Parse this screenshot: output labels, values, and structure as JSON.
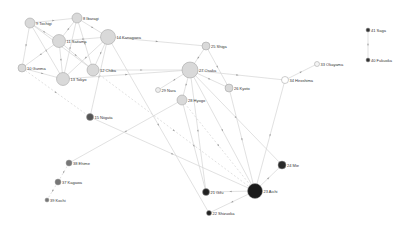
{
  "diagram": {
    "type": "network-graph",
    "nodes": [
      {
        "id": "9",
        "label": "9 Tochigi",
        "x": 30,
        "y": 23,
        "r": 5,
        "color": "#d9d9d9"
      },
      {
        "id": "8",
        "label": "8 Ibaragi",
        "x": 77,
        "y": 18,
        "r": 5,
        "color": "#d9d9d9"
      },
      {
        "id": "11",
        "label": "11 Saitama",
        "x": 59,
        "y": 41,
        "r": 6.5,
        "color": "#d9d9d9"
      },
      {
        "id": "14",
        "label": "14 Kanagawa",
        "x": 108,
        "y": 37,
        "r": 7.5,
        "color": "#d9d9d9"
      },
      {
        "id": "10",
        "label": "10 Gunma",
        "x": 22,
        "y": 68,
        "r": 4,
        "color": "#d9d9d9"
      },
      {
        "id": "13",
        "label": "13 Tokyo",
        "x": 63,
        "y": 79,
        "r": 6.5,
        "color": "#d9d9d9"
      },
      {
        "id": "12",
        "label": "12 Chiba",
        "x": 93,
        "y": 70,
        "r": 6,
        "color": "#d9d9d9"
      },
      {
        "id": "25",
        "label": "25 Shiga",
        "x": 206,
        "y": 46,
        "r": 4,
        "color": "#d9d9d9"
      },
      {
        "id": "27",
        "label": "27 Osaka",
        "x": 190,
        "y": 70,
        "r": 8,
        "color": "#d9d9d9"
      },
      {
        "id": "33",
        "label": "33 Okayama",
        "x": 317,
        "y": 64,
        "r": 2.5,
        "color": "#f4f4f4"
      },
      {
        "id": "34",
        "label": "34 Hiroshima",
        "x": 285,
        "y": 80,
        "r": 3.5,
        "color": "#ffffff"
      },
      {
        "id": "29",
        "label": "29 Nara",
        "x": 158,
        "y": 90,
        "r": 2.5,
        "color": "#eeeeee"
      },
      {
        "id": "26",
        "label": "26 Kyoto",
        "x": 229,
        "y": 88,
        "r": 4,
        "color": "#d9d9d9"
      },
      {
        "id": "28",
        "label": "28 Hyogo",
        "x": 182,
        "y": 100,
        "r": 5,
        "color": "#d9d9d9"
      },
      {
        "id": "15",
        "label": "15 Niigata",
        "x": 90,
        "y": 117,
        "r": 3.5,
        "color": "#555555"
      },
      {
        "id": "41",
        "label": "41 Saga",
        "x": 368,
        "y": 30,
        "r": 2,
        "color": "#333333"
      },
      {
        "id": "40",
        "label": "40 Fukuoka",
        "x": 368,
        "y": 60,
        "r": 2,
        "color": "#333333"
      },
      {
        "id": "38",
        "label": "38 Ehime",
        "x": 69,
        "y": 163,
        "r": 3,
        "color": "#777777"
      },
      {
        "id": "37",
        "label": "37 Kagawa",
        "x": 58,
        "y": 182,
        "r": 3,
        "color": "#777777"
      },
      {
        "id": "39",
        "label": "39 Kochi",
        "x": 47,
        "y": 200,
        "r": 2,
        "color": "#777777"
      },
      {
        "id": "24",
        "label": "24 Mie",
        "x": 282,
        "y": 165,
        "r": 4,
        "color": "#2a2a2a"
      },
      {
        "id": "23",
        "label": "23 Aichi",
        "x": 255,
        "y": 191,
        "r": 7.5,
        "color": "#1a1a1a"
      },
      {
        "id": "21",
        "label": "21 Gifu",
        "x": 206,
        "y": 192,
        "r": 3.5,
        "color": "#222222"
      },
      {
        "id": "22",
        "label": "22 Shizuoka",
        "x": 209,
        "y": 213,
        "r": 2.5,
        "color": "#222222"
      }
    ],
    "edges": [
      {
        "from": "9",
        "to": "8"
      },
      {
        "from": "9",
        "to": "11"
      },
      {
        "from": "9",
        "to": "10"
      },
      {
        "from": "9",
        "to": "13"
      },
      {
        "from": "9",
        "to": "12"
      },
      {
        "from": "8",
        "to": "11"
      },
      {
        "from": "8",
        "to": "14"
      },
      {
        "from": "8",
        "to": "13"
      },
      {
        "from": "8",
        "to": "12"
      },
      {
        "from": "11",
        "to": "14"
      },
      {
        "from": "11",
        "to": "10"
      },
      {
        "from": "11",
        "to": "13"
      },
      {
        "from": "11",
        "to": "12"
      },
      {
        "from": "14",
        "to": "13"
      },
      {
        "from": "14",
        "to": "12"
      },
      {
        "from": "14",
        "to": "25"
      },
      {
        "from": "14",
        "to": "15"
      },
      {
        "from": "14",
        "to": "22"
      },
      {
        "from": "10",
        "to": "13"
      },
      {
        "from": "10",
        "to": "15",
        "dashed": true
      },
      {
        "from": "13",
        "to": "27"
      },
      {
        "from": "12",
        "to": "27"
      },
      {
        "from": "12",
        "to": "23",
        "dashed": true
      },
      {
        "from": "15",
        "to": "23"
      },
      {
        "from": "25",
        "to": "27"
      },
      {
        "from": "25",
        "to": "26"
      },
      {
        "from": "27",
        "to": "34"
      },
      {
        "from": "27",
        "to": "29"
      },
      {
        "from": "27",
        "to": "26"
      },
      {
        "from": "27",
        "to": "28"
      },
      {
        "from": "27",
        "to": "23"
      },
      {
        "from": "27",
        "to": "24"
      },
      {
        "from": "27",
        "to": "21"
      },
      {
        "from": "26",
        "to": "23"
      },
      {
        "from": "28",
        "to": "38"
      },
      {
        "from": "28",
        "to": "23",
        "dashed": true
      },
      {
        "from": "28",
        "to": "21"
      },
      {
        "from": "34",
        "to": "33"
      },
      {
        "from": "34",
        "to": "23"
      },
      {
        "from": "41",
        "to": "40"
      },
      {
        "from": "38",
        "to": "37",
        "dashed": true
      },
      {
        "from": "37",
        "to": "39",
        "dashed": true
      },
      {
        "from": "23",
        "to": "24"
      },
      {
        "from": "23",
        "to": "21"
      },
      {
        "from": "23",
        "to": "22"
      }
    ]
  }
}
